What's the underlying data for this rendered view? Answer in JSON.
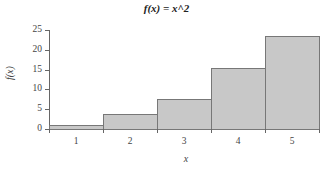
{
  "chart_data": {
    "type": "bar",
    "title": "f(x) = x^2",
    "xlabel": "x",
    "ylabel": "f(x)",
    "categories": [
      "1",
      "2",
      "3",
      "4",
      "5"
    ],
    "values": [
      1,
      3.75,
      7.5,
      15.5,
      23.5
    ],
    "ylim": [
      0,
      25
    ],
    "yticks": [
      0,
      5,
      10,
      15,
      20,
      25
    ],
    "grid": false,
    "legend": null,
    "bar_color": "#c8c8c8",
    "bar_edge_color": "#777777"
  }
}
